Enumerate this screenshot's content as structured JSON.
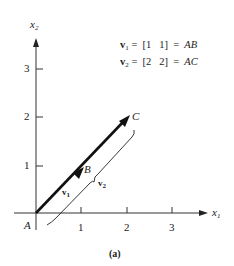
{
  "figure": {
    "caption": "(a)",
    "axes": {
      "x_label": "x",
      "x_sub": "1",
      "y_label": "x",
      "y_sub": "2",
      "x_ticks": [
        "1",
        "2",
        "3"
      ],
      "y_ticks": [
        "1",
        "2",
        "3"
      ]
    },
    "points": {
      "origin": "A",
      "b": "B",
      "c": "C"
    },
    "vectors": {
      "v1_name": "v",
      "v1_sub": "1",
      "v2_name": "v",
      "v2_sub": "2"
    },
    "equations": [
      {
        "lhs": "v",
        "sub": "1",
        "rhs": "=  [1   1]  =  ",
        "seg": "AB"
      },
      {
        "lhs": "v",
        "sub": "2",
        "rhs": "=  [2   2]  =  ",
        "seg": "AC"
      }
    ]
  }
}
